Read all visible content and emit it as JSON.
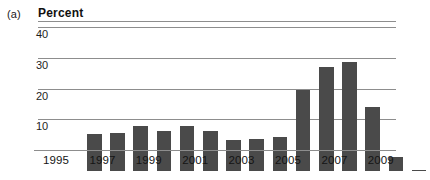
{
  "panel": {
    "label": "(a)"
  },
  "axis_title": "Percent",
  "chart_data": {
    "type": "bar",
    "title": "Percent",
    "xlabel": "",
    "ylabel": "Percent",
    "ylim": [
      0,
      42
    ],
    "yticks": [
      10,
      20,
      30,
      40
    ],
    "grid": true,
    "legend": "none",
    "categories": [
      "1995",
      "1996",
      "1997",
      "1998",
      "1999",
      "2000",
      "2001",
      "2002",
      "2003",
      "2004",
      "2005",
      "2006",
      "2007",
      "2008",
      "2009"
    ],
    "visible_xtick_labels": [
      "1995",
      "1997",
      "1999",
      "2001",
      "2003",
      "2005",
      "2007",
      "2009"
    ],
    "values": [
      12.0,
      12.5,
      14.5,
      13.0,
      14.5,
      13.0,
      10.0,
      10.3,
      11.0,
      26.5,
      34.0,
      35.5,
      21.0,
      4.5,
      0.3
    ],
    "bar_color": "#4a4a4a",
    "gridline_color": "#8d8d8d"
  }
}
